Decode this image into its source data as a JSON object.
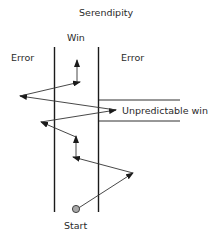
{
  "title": "Serendipity",
  "labels": {
    "win": "Win",
    "error_left": "Error",
    "error_right": "Error",
    "unpredictable": "Unpredictable win",
    "start": "Start"
  },
  "colors": {
    "line": "#1a1a1a",
    "arrow": "#333333",
    "start_fill": "#a8a8a8"
  },
  "path_steps": [
    {
      "from": "start",
      "to": "right-error-zone"
    },
    {
      "from": "right-error-zone",
      "to": "win-corridor"
    },
    {
      "from": "win-corridor",
      "to": "win-corridor-up"
    },
    {
      "from": "win-corridor-up",
      "to": "left-error-zone"
    },
    {
      "from": "left-error-zone",
      "to": "unpredictable-win"
    },
    {
      "from": "unpredictable-win",
      "to": "left-error-zone"
    },
    {
      "from": "left-error-zone",
      "to": "win-corridor"
    },
    {
      "from": "win-corridor",
      "to": "win"
    }
  ]
}
